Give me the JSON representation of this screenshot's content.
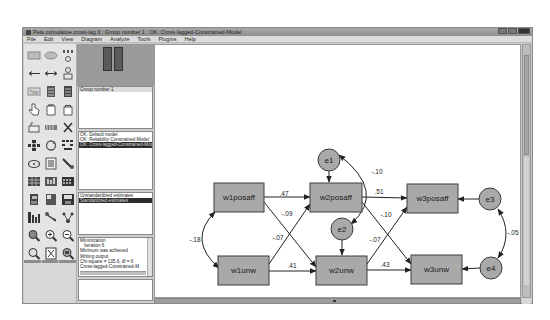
{
  "window": {
    "title": "Pets cumulative cross-lag 3 : Group number 1 : OK: Cross-lagged-Constrained-Model"
  },
  "menu": {
    "items": [
      "File",
      "Edit",
      "View",
      "Diagram",
      "Analyze",
      "Tools",
      "Plugins",
      "Help"
    ]
  },
  "toolbar": {
    "icons": [
      "draw-observed-variable-icon",
      "draw-unobserved-variable-icon",
      "draw-indicator-variable-icon",
      "draw-path-icon",
      "draw-covariance-icon",
      "add-unique-variable-icon",
      "title-icon",
      "list-variables-in-model-icon",
      "list-variables-in-dataset-icon",
      "select-one-object-icon",
      "select-all-objects-icon",
      "deselect-all-icon",
      "duplicate-objects-icon",
      "move-objects-icon",
      "erase-objects-icon",
      "change-shape-icon",
      "rotate-indicators-icon",
      "reflect-indicators-icon",
      "move-parameter-values-icon",
      "scroll-icon",
      "touch-up-icon",
      "data-files-icon",
      "analysis-properties-icon",
      "calculate-estimates-icon",
      "copy-to-clipboard-icon",
      "view-text-icon",
      "save-diagram-icon",
      "object-properties-icon",
      "drag-properties-icon",
      "preserve-symmetries-icon",
      "zoom-in-area-icon",
      "zoom-in-icon",
      "zoom-out-icon",
      "show-page-icon",
      "resize-to-fit-icon",
      "loupe-icon",
      "bayesian-estimation-icon",
      "multiple-group-analysis-icon",
      "print-icon",
      "undo-icon",
      "redo-icon",
      "specification-search-icon"
    ]
  },
  "panels": {
    "groups": {
      "items": [
        "Group number 1"
      ]
    },
    "models": {
      "items": [
        {
          "label": "OK: Default model",
          "selected": false
        },
        {
          "label": "OK: Reliability-Constrained-Model",
          "selected": false
        },
        {
          "label": "OK: Cross-lagged-Constrained-Model",
          "selected": true
        }
      ]
    },
    "estimates": {
      "items": [
        {
          "label": "Unstandardized estimates",
          "selected": false
        },
        {
          "label": "Standardized estimates",
          "selected": true
        }
      ]
    },
    "output": {
      "lines": [
        {
          "text": "Minimization",
          "indent": false
        },
        {
          "text": "Iteration 6",
          "indent": true
        },
        {
          "text": "Minimum was achieved",
          "indent": false
        },
        {
          "text": "Writing output",
          "indent": false
        },
        {
          "text": "Chi-square = 135.6, df = 6",
          "indent": false
        },
        {
          "text": "Cross-lagged-Constrained-M",
          "indent": false
        }
      ]
    }
  },
  "diagram": {
    "observed": [
      {
        "id": "w1posaff",
        "label": "w1posaff"
      },
      {
        "id": "w2posaff",
        "label": "w2posaff"
      },
      {
        "id": "w3posaff",
        "label": "w3posaff"
      },
      {
        "id": "w1unw",
        "label": "w1unw"
      },
      {
        "id": "w2unw",
        "label": "w2unw"
      },
      {
        "id": "w3unw",
        "label": "w3unw"
      }
    ],
    "errors": [
      {
        "id": "e1",
        "label": "e1"
      },
      {
        "id": "e2",
        "label": "e2"
      },
      {
        "id": "e3",
        "label": "e3"
      },
      {
        "id": "e4",
        "label": "e4"
      }
    ],
    "paths": [
      {
        "from": "w1posaff",
        "to": "w2posaff",
        "value": ".47"
      },
      {
        "from": "w1posaff",
        "to": "w2unw",
        "value": "-.09"
      },
      {
        "from": "w1unw",
        "to": "w2posaff",
        "value": "-.07"
      },
      {
        "from": "w1unw",
        "to": "w2unw",
        "value": ".41"
      },
      {
        "from": "w2posaff",
        "to": "w3posaff",
        "value": ".51"
      },
      {
        "from": "w2posaff",
        "to": "w3unw",
        "value": "-.10"
      },
      {
        "from": "w2unw",
        "to": "w3posaff",
        "value": "-.07"
      },
      {
        "from": "w2unw",
        "to": "w3unw",
        "value": ".43"
      }
    ],
    "covariances": [
      {
        "between": [
          "w1posaff",
          "w1unw"
        ],
        "value": "-.18"
      },
      {
        "between": [
          "e1",
          "e2"
        ],
        "value": "-.10"
      },
      {
        "between": [
          "e3",
          "e4"
        ],
        "value": "-.05"
      }
    ]
  }
}
